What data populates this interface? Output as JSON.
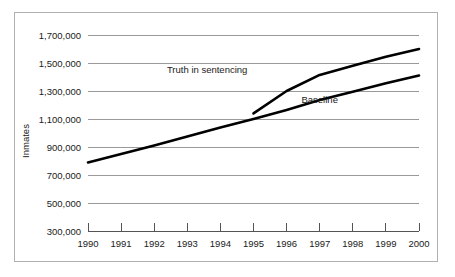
{
  "chart_data": {
    "type": "line",
    "title": "",
    "xlabel": "",
    "ylabel": "Inmates",
    "x": [
      1990,
      1991,
      1992,
      1993,
      1994,
      1995,
      1996,
      1997,
      1998,
      1999,
      2000
    ],
    "xtick_labels": [
      "1990",
      "1991",
      "1992",
      "1993",
      "1994",
      "1995",
      "1996",
      "1997",
      "1998",
      "1999",
      "2000"
    ],
    "ytick_labels": [
      "300,000",
      "500,000",
      "700,000",
      "900,000",
      "1,100,000",
      "1,300,000",
      "1,500,000",
      "1,700,000"
    ],
    "yticks": [
      300000,
      500000,
      700000,
      900000,
      1100000,
      1300000,
      1500000,
      1700000
    ],
    "ylim": [
      300000,
      1700000
    ],
    "xlim": [
      1990,
      2000
    ],
    "grid": true,
    "legend_position": "inline-annotation",
    "series": [
      {
        "name": "Baseline",
        "label": "Baseline",
        "color": "#000000",
        "x": [
          1990,
          1991,
          1992,
          1993,
          1994,
          1995,
          1996,
          1997,
          1998,
          1999,
          2000
        ],
        "values": [
          790000,
          850000,
          910000,
          975000,
          1040000,
          1100000,
          1165000,
          1235000,
          1295000,
          1355000,
          1410000
        ]
      },
      {
        "name": "Truth in sentencing",
        "label": "Truth in sentencing",
        "color": "#000000",
        "x": [
          1995,
          1996,
          1997,
          1998,
          1999,
          2000
        ],
        "values": [
          1140000,
          1300000,
          1415000,
          1480000,
          1545000,
          1600000
        ]
      }
    ],
    "annotations": [
      {
        "text": "Truth in sentencing",
        "x": 1993.6,
        "y": 1432000
      },
      {
        "text": "Baseline",
        "x": 1997.0,
        "y": 1215000
      }
    ]
  }
}
